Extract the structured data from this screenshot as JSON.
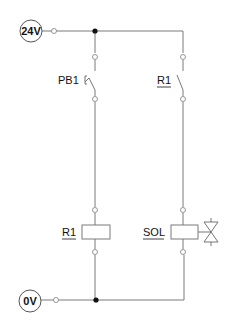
{
  "diagram": {
    "type": "electrical ladder diagram",
    "supply_top": {
      "label": "24V"
    },
    "supply_bottom": {
      "label": "0V"
    },
    "rungs": [
      {
        "contact": {
          "label": "PB1",
          "kind": "pushbutton normally-open"
        },
        "load": {
          "label": "R1",
          "kind": "relay coil",
          "underlined": true
        }
      },
      {
        "contact": {
          "label": "R1",
          "kind": "relay contact normally-open",
          "underlined": true
        },
        "load": {
          "label": "SOL",
          "kind": "solenoid valve coil",
          "underlined": true
        }
      }
    ],
    "colors": {
      "wire": "#7a7a7a",
      "junction": "#111111",
      "text": "#111111"
    }
  }
}
